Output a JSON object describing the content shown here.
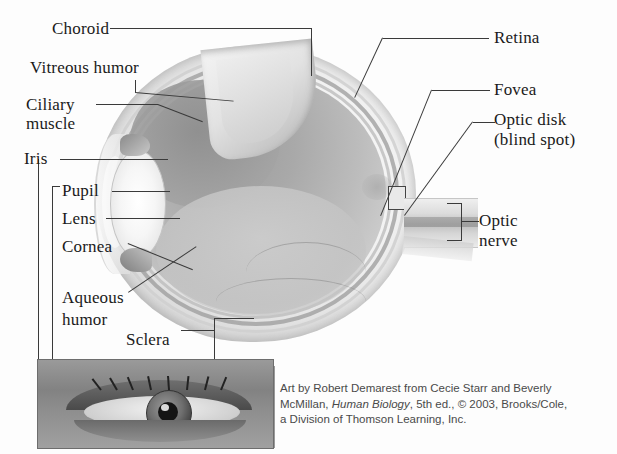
{
  "figure": {
    "labels": {
      "choroid": "Choroid",
      "vitreous_humor": "Vitreous humor",
      "ciliary_muscle_l1": "Ciliary",
      "ciliary_muscle_l2": "muscle",
      "iris": "Iris",
      "pupil": "Pupil",
      "lens": "Lens",
      "cornea": "Cornea",
      "aqueous_l1": "Aqueous",
      "aqueous_l2": "humor",
      "sclera": "Sclera",
      "retina": "Retina",
      "fovea": "Fovea",
      "optic_disk_l1": "Optic disk",
      "optic_disk_l2": "(blind spot)",
      "optic_nerve_l1": "Optic",
      "optic_nerve_l2": "nerve"
    },
    "caption": {
      "line1_a": "Art by Robert Demarest from Cecie Starr and Beverly",
      "line2_a": "McMillan, ",
      "line2_italic": "Human Biology",
      "line2_b": ", 5th ed., © 2003, Brooks/Cole,",
      "line3": "a Division of Thomson Learning, Inc."
    },
    "colors": {
      "ink": "#1a1a1a",
      "leader": "#3a3a3a",
      "caption_text": "#4a4a4a",
      "sclera": "#f2f2f2",
      "vitreous": "#a8a8a8",
      "lens": "#f4f4f4",
      "photo_base": "#8b8b8b"
    }
  }
}
